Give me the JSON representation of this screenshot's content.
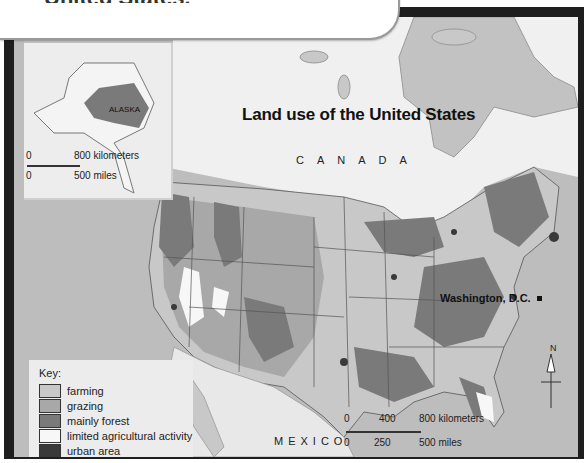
{
  "header": {
    "title": "United States."
  },
  "map": {
    "title": "Land use of the United States",
    "labels": {
      "canada": "CANADA",
      "mexico": "MEXICO",
      "alaska": "ALASKA",
      "capital": "Washington, D.C."
    },
    "inset_scale": {
      "km_zero": "0",
      "km_max": "800 kilometers",
      "mi_zero": "0",
      "mi_max": "500 miles"
    },
    "main_scale": {
      "km_ticks": [
        "0",
        "400",
        "800 kilometers"
      ],
      "mi_ticks": [
        "0",
        "250",
        "500 miles"
      ]
    },
    "compass": {
      "north_label": "N"
    }
  },
  "key": {
    "title": "Key:",
    "items": [
      {
        "label": "farming",
        "color": "#c8c8c8"
      },
      {
        "label": "grazing",
        "color": "#a8a8a8"
      },
      {
        "label": "mainly forest",
        "color": "#7a7a7a"
      },
      {
        "label": "limited agricultural activity",
        "color": "#f7f7f7"
      },
      {
        "label": "urban area",
        "color": "#3a3a3a"
      }
    ]
  }
}
